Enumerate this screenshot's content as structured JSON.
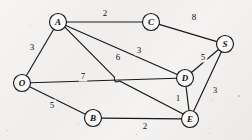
{
  "diagram": {
    "background_color": "#f2f2f0",
    "ink_color": "#18181a",
    "node_fill_color": "#faf9f7",
    "nodes": [
      {
        "id": "A",
        "label": "A",
        "x": 58,
        "y": 22,
        "r": 8.5
      },
      {
        "id": "C",
        "label": "C",
        "x": 151,
        "y": 22,
        "r": 8.5
      },
      {
        "id": "S",
        "label": "S",
        "x": 225,
        "y": 44,
        "r": 8.5
      },
      {
        "id": "O",
        "label": "O",
        "x": 22,
        "y": 83,
        "r": 8.5
      },
      {
        "id": "D",
        "label": "D",
        "x": 185,
        "y": 78,
        "r": 8.5
      },
      {
        "id": "B",
        "label": "B",
        "x": 93,
        "y": 118,
        "r": 8.5
      },
      {
        "id": "E",
        "label": "E",
        "x": 190,
        "y": 119,
        "r": 8.5
      }
    ],
    "edges": [
      {
        "id": "A-C",
        "from": "A",
        "to": "C",
        "weight": "2",
        "label_x": 105,
        "label_y": 13,
        "hop": false
      },
      {
        "id": "C-S",
        "from": "C",
        "to": "S",
        "weight": "8",
        "label_x": 194,
        "label_y": 17,
        "hop": false
      },
      {
        "id": "A-O",
        "from": "A",
        "to": "O",
        "weight": "3",
        "label_x": 32,
        "label_y": 47,
        "hop": false
      },
      {
        "id": "A-D",
        "from": "A",
        "to": "D",
        "weight": "3",
        "label_x": 139,
        "label_y": 50,
        "hop": false
      },
      {
        "id": "A-E",
        "from": "A",
        "to": "E",
        "weight": "6",
        "label_x": 118,
        "label_y": 57,
        "hop": true
      },
      {
        "id": "O-D",
        "from": "O",
        "to": "D",
        "weight": "7",
        "label_x": 83,
        "label_y": 76,
        "hop": false
      },
      {
        "id": "O-B",
        "from": "O",
        "to": "B",
        "weight": "5",
        "label_x": 52,
        "label_y": 105,
        "hop": false
      },
      {
        "id": "D-S",
        "from": "D",
        "to": "S",
        "weight": "5",
        "label_x": 203,
        "label_y": 57,
        "hop": false
      },
      {
        "id": "D-E",
        "from": "D",
        "to": "E",
        "weight": "1",
        "label_x": 178,
        "label_y": 98,
        "hop": false
      },
      {
        "id": "E-S",
        "from": "E",
        "to": "S",
        "weight": "3",
        "label_x": 215,
        "label_y": 90,
        "hop": false
      },
      {
        "id": "B-E",
        "from": "B",
        "to": "E",
        "weight": "2",
        "label_x": 145,
        "label_y": 126,
        "hop": false
      }
    ],
    "crossing_hop": {
      "x": 117,
      "y": 79,
      "r": 3.2
    },
    "specks": [
      {
        "x": 238,
        "y": 95,
        "size": 2
      },
      {
        "x": 209,
        "y": 133,
        "size": 1
      },
      {
        "x": 7,
        "y": 130,
        "size": 1
      },
      {
        "x": 136,
        "y": 134,
        "size": 1
      }
    ]
  }
}
